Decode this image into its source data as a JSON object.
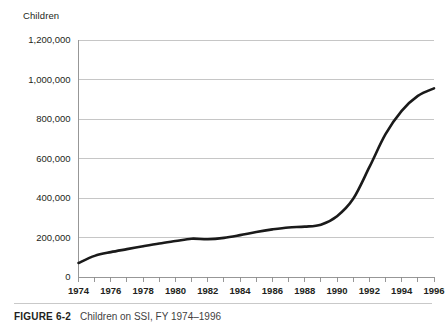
{
  "figure": {
    "caption_label": "FIGURE 6-2",
    "caption_title": "Children on SSI, FY 1974–1996"
  },
  "chart_data": {
    "type": "line",
    "title": "",
    "subtitle": "",
    "xlabel": "",
    "ylabel": "Children",
    "ylim": [
      0,
      1200000
    ],
    "xlim": [
      1974,
      1996
    ],
    "grid": true,
    "legend": false,
    "legend_position": "none",
    "ytick_labels": [
      "0",
      "200,000",
      "400,000",
      "600,000",
      "800,000",
      "1,000,000",
      "1,200,000"
    ],
    "ytick_values": [
      0,
      200000,
      400000,
      600000,
      800000,
      1000000,
      1200000
    ],
    "xtick_labels": [
      "1974",
      "1976",
      "1978",
      "1980",
      "1982",
      "1984",
      "1986",
      "1988",
      "1990",
      "1992",
      "1994",
      "1996"
    ],
    "xtick_values": [
      1974,
      1976,
      1978,
      1980,
      1982,
      1984,
      1986,
      1988,
      1990,
      1992,
      1994,
      1996
    ],
    "x_minor_ticks": [
      1974,
      1975,
      1976,
      1977,
      1978,
      1979,
      1980,
      1981,
      1982,
      1983,
      1984,
      1985,
      1986,
      1987,
      1988,
      1989,
      1990,
      1991,
      1992,
      1993,
      1994,
      1995,
      1996
    ],
    "series": [
      {
        "name": "Children on SSI",
        "color": "#1a1a1a",
        "x": [
          1974,
          1975,
          1976,
          1977,
          1978,
          1979,
          1980,
          1981,
          1982,
          1983,
          1984,
          1985,
          1986,
          1987,
          1988,
          1989,
          1990,
          1991,
          1992,
          1993,
          1994,
          1995,
          1996
        ],
        "values": [
          71000,
          107000,
          126000,
          141000,
          156000,
          170000,
          182000,
          194000,
          191000,
          198000,
          212000,
          228000,
          241000,
          251000,
          255000,
          265000,
          308000,
          396000,
          556000,
          723000,
          841000,
          917000,
          955000
        ]
      }
    ]
  }
}
